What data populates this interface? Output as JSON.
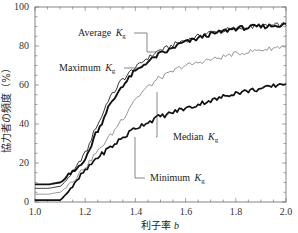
{
  "chart_data": {
    "type": "line",
    "title": "",
    "xlabel": "利子率 b",
    "ylabel": "協力者の頻度（%）",
    "xlim": [
      1.0,
      2.0
    ],
    "ylim": [
      0,
      100
    ],
    "grid": false,
    "legend_position": "inline annotations",
    "x_ticks": [
      "1.0",
      "1.2",
      "1.4",
      "1.6",
      "1.8",
      "2.0"
    ],
    "y_ticks": [
      "0",
      "20",
      "40",
      "60",
      "80",
      "100"
    ],
    "x": [
      1.0,
      1.05,
      1.1,
      1.15,
      1.2,
      1.25,
      1.3,
      1.35,
      1.4,
      1.45,
      1.5,
      1.6,
      1.7,
      1.8,
      1.9,
      2.0
    ],
    "series": [
      {
        "name": "Average Kg",
        "label": "Average",
        "style": "thin black",
        "values": [
          7,
          7,
          8,
          15,
          25,
          40,
          54,
          63,
          69,
          74,
          78,
          83,
          87,
          89,
          90,
          91
        ]
      },
      {
        "name": "Maximum Kg",
        "label": "Maximum",
        "style": "thick black",
        "values": [
          9,
          9,
          10,
          15,
          22,
          37,
          50,
          60,
          67,
          72,
          76,
          82,
          86,
          89,
          90,
          91
        ]
      },
      {
        "name": "Median Kg",
        "label": "Median",
        "style": "thin gray",
        "values": [
          4,
          4,
          5,
          11,
          18,
          26,
          34,
          43,
          53,
          59,
          64,
          70,
          73,
          76,
          78,
          80
        ]
      },
      {
        "name": "Minimum Kg",
        "label": "Minimum",
        "style": "thick black",
        "values": [
          1,
          1,
          1,
          8,
          16,
          23,
          28,
          33,
          38,
          41,
          44,
          48,
          52,
          56,
          58,
          61
        ]
      }
    ]
  },
  "axes": {
    "x_title_main": "利子率",
    "x_title_var": "b",
    "y_title": "協力者の頻度（%）",
    "x_ticks": [
      "1.0",
      "1.2",
      "1.4",
      "1.6",
      "1.8",
      "2.0"
    ],
    "y_ticks": [
      "0",
      "20",
      "40",
      "60",
      "80",
      "100"
    ]
  },
  "annotations": {
    "average": {
      "text": "Average",
      "k": "K",
      "sub": "g"
    },
    "maximum": {
      "text": "Maximum",
      "k": "K",
      "sub": "g"
    },
    "median": {
      "text": "Median",
      "k": "K",
      "sub": "g"
    },
    "minimum": {
      "text": "Minimum",
      "k": "K",
      "sub": "g"
    }
  }
}
